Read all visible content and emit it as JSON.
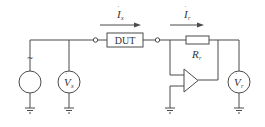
{
  "diagram": {
    "title": "",
    "components": {
      "ac_source": {
        "symbol": "~"
      },
      "source_voltmeter": {
        "label": "V",
        "subscript": "x"
      },
      "dut": {
        "label": "DUT"
      },
      "resistor": {
        "label": "R",
        "subscript": "r"
      },
      "output_voltmeter": {
        "label": "V",
        "subscript": "r"
      },
      "opamp": {
        "label": ""
      }
    },
    "currents": [
      {
        "label": "I",
        "subscript": "x",
        "direction": "right"
      },
      {
        "label": "I",
        "subscript": "r",
        "direction": "right"
      }
    ],
    "colors": {
      "line": "#4a4a4a",
      "text": "#333333",
      "background": "#ffffff"
    }
  }
}
